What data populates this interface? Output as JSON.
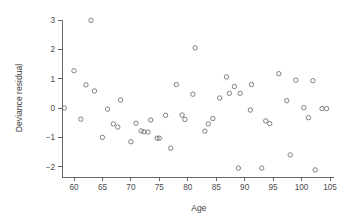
{
  "chart_data": {
    "type": "scatter",
    "title": "",
    "xlabel": "Age",
    "ylabel": "Deviance residual",
    "xlim": [
      58.0,
      105.5
    ],
    "ylim": [
      -2.35,
      3.15
    ],
    "grid": false,
    "legend": null,
    "marker": "open-circle",
    "marker_color": "#6b6b6b",
    "xticks": [
      60,
      65,
      70,
      75,
      80,
      85,
      90,
      95,
      100,
      105
    ],
    "xtick_labels": [
      "60",
      "65",
      "70",
      "75",
      "80",
      "85",
      "90",
      "95",
      "100",
      "105"
    ],
    "yticks": [
      -2,
      -1,
      0,
      1,
      2,
      3
    ],
    "ytick_labels": [
      "-2",
      "-1",
      "0",
      "1",
      "2",
      "3"
    ],
    "x": [
      58.3,
      60.0,
      61.2,
      62.1,
      63.0,
      63.6,
      65.0,
      65.9,
      66.9,
      67.7,
      68.2,
      70.0,
      70.9,
      71.8,
      72.3,
      73.0,
      73.5,
      74.6,
      75.0,
      76.1,
      77.0,
      78.0,
      79.0,
      79.5,
      80.9,
      81.3,
      83.0,
      83.6,
      84.4,
      85.6,
      86.8,
      87.3,
      88.2,
      88.9,
      89.2,
      91.0,
      91.2,
      93.0,
      93.7,
      94.4,
      96.0,
      97.4,
      98.0,
      99.0,
      100.4,
      101.2,
      102.0,
      102.4,
      103.6,
      104.4
    ],
    "y": [
      0.0,
      1.27,
      -0.38,
      0.79,
      2.99,
      0.58,
      -1.0,
      -0.04,
      -0.54,
      -0.65,
      0.27,
      -1.15,
      -0.52,
      -0.78,
      -0.81,
      -0.82,
      -0.41,
      -1.03,
      -1.03,
      -0.25,
      -1.37,
      0.8,
      -0.24,
      -0.39,
      0.47,
      2.05,
      -0.79,
      -0.54,
      -0.36,
      0.34,
      1.06,
      0.5,
      0.73,
      -2.05,
      0.5,
      -0.07,
      0.8,
      -2.05,
      -0.44,
      -0.53,
      1.17,
      0.25,
      -1.6,
      0.95,
      0.01,
      -0.33,
      0.93,
      -2.11,
      -0.02,
      -0.02
    ],
    "points": [
      {
        "age": 58.3,
        "residual": 0.0
      },
      {
        "age": 60.0,
        "residual": 1.27
      },
      {
        "age": 61.2,
        "residual": -0.38
      },
      {
        "age": 62.1,
        "residual": 0.79
      },
      {
        "age": 63.0,
        "residual": 2.99
      },
      {
        "age": 63.6,
        "residual": 0.58
      },
      {
        "age": 65.0,
        "residual": -1.0
      },
      {
        "age": 65.9,
        "residual": -0.04
      },
      {
        "age": 66.9,
        "residual": -0.54
      },
      {
        "age": 67.7,
        "residual": -0.65
      },
      {
        "age": 68.2,
        "residual": 0.27
      },
      {
        "age": 70.0,
        "residual": -1.15
      },
      {
        "age": 70.9,
        "residual": -0.52
      },
      {
        "age": 71.8,
        "residual": -0.78
      },
      {
        "age": 72.3,
        "residual": -0.81
      },
      {
        "age": 73.0,
        "residual": -0.82
      },
      {
        "age": 73.5,
        "residual": -0.41
      },
      {
        "age": 74.6,
        "residual": -1.03
      },
      {
        "age": 75.0,
        "residual": -1.03
      },
      {
        "age": 76.1,
        "residual": -0.25
      },
      {
        "age": 77.0,
        "residual": -1.37
      },
      {
        "age": 78.0,
        "residual": 0.8
      },
      {
        "age": 79.0,
        "residual": -0.24
      },
      {
        "age": 79.5,
        "residual": -0.39
      },
      {
        "age": 80.9,
        "residual": 0.47
      },
      {
        "age": 81.3,
        "residual": 2.05
      },
      {
        "age": 83.0,
        "residual": -0.79
      },
      {
        "age": 83.6,
        "residual": -0.54
      },
      {
        "age": 84.4,
        "residual": -0.36
      },
      {
        "age": 85.6,
        "residual": 0.34
      },
      {
        "age": 86.8,
        "residual": 1.06
      },
      {
        "age": 87.3,
        "residual": 0.5
      },
      {
        "age": 88.2,
        "residual": 0.73
      },
      {
        "age": 88.9,
        "residual": -2.05
      },
      {
        "age": 89.2,
        "residual": 0.5
      },
      {
        "age": 91.0,
        "residual": -0.07
      },
      {
        "age": 91.2,
        "residual": 0.8
      },
      {
        "age": 93.0,
        "residual": -2.05
      },
      {
        "age": 93.7,
        "residual": -0.44
      },
      {
        "age": 94.4,
        "residual": -0.53
      },
      {
        "age": 96.0,
        "residual": 1.17
      },
      {
        "age": 97.4,
        "residual": 0.25
      },
      {
        "age": 98.0,
        "residual": -1.6
      },
      {
        "age": 99.0,
        "residual": 0.95
      },
      {
        "age": 100.4,
        "residual": 0.01
      },
      {
        "age": 101.2,
        "residual": -0.33
      },
      {
        "age": 102.0,
        "residual": 0.93
      },
      {
        "age": 102.4,
        "residual": -2.11
      },
      {
        "age": 103.6,
        "residual": -0.02
      },
      {
        "age": 104.4,
        "residual": -0.02
      }
    ]
  },
  "colors": {
    "background": "#ffffff",
    "axis": "#5a5a5a",
    "text": "#3c3c3c",
    "marker": "#6b6b6b"
  }
}
